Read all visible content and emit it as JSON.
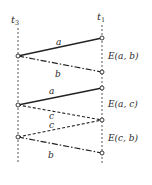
{
  "diagram": {
    "type": "space-time / sequence diagram",
    "colors": {
      "ink": "#2a2a2a",
      "background": "#ffffff"
    },
    "timelines": [
      {
        "id": "t3",
        "label": "t",
        "subscript": "3",
        "x": 18
      },
      {
        "id": "t1",
        "label": "t",
        "subscript": "1",
        "x": 102
      }
    ],
    "segments": [
      {
        "id": "a1",
        "label": "a",
        "style": "solid",
        "from": "t3",
        "to": "t1"
      },
      {
        "id": "b1",
        "label": "b",
        "style": "dash-dot",
        "from": "t3",
        "to": "t1"
      },
      {
        "id": "a2",
        "label": "a",
        "style": "solid",
        "from": "t3",
        "to": "t1"
      },
      {
        "id": "c1",
        "label": "c",
        "style": "dashed",
        "from": "t3",
        "to": "t1"
      },
      {
        "id": "c2",
        "label": "c",
        "style": "dashed",
        "from": "t3",
        "to": "t1"
      },
      {
        "id": "b2",
        "label": "b",
        "style": "dash-dot",
        "from": "t3",
        "to": "t1"
      }
    ],
    "events": [
      {
        "id": "e1",
        "label": "E(a, b)"
      },
      {
        "id": "e2",
        "label": "E(a, c)"
      },
      {
        "id": "e3",
        "label": "E(c, b)"
      }
    ]
  }
}
